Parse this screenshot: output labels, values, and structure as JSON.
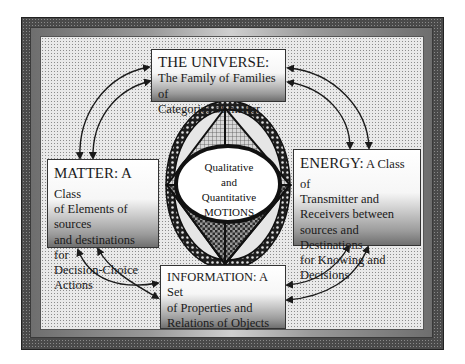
{
  "diagram": {
    "universe": {
      "head": "THE UNIVERSE:",
      "body_lines": [
        "The Family of Families of",
        "Categories of matter"
      ]
    },
    "matter": {
      "head": "MATTER: A",
      "head_tail": " Class",
      "body_lines": [
        "of Elements of sources",
        "and destinations for",
        "Decision-Choice",
        "Actions"
      ]
    },
    "energy": {
      "head": "ENERGY:",
      "head_tail": " A Class of",
      "body_lines": [
        "Transmitter and",
        "Receivers between",
        "sources and Destinations",
        "for Knowing and",
        "Decisions"
      ]
    },
    "information": {
      "head": "INFORMATION: A Set",
      "body_lines": [
        "of Properties and",
        "Relations of Objects"
      ]
    },
    "center": {
      "lines": [
        "Qualitative",
        "and",
        "Quantitative",
        "MOTIONS"
      ]
    },
    "connections": [
      {
        "from": "universe",
        "to": "matter",
        "type": "double-arrow",
        "count": 2
      },
      {
        "from": "universe",
        "to": "energy",
        "type": "double-arrow",
        "count": 2
      },
      {
        "from": "matter",
        "to": "information",
        "type": "double-arrow",
        "count": 2
      },
      {
        "from": "energy",
        "to": "information",
        "type": "double-arrow",
        "count": 2
      }
    ],
    "colors": {
      "frame_dark": "#4a4a4a",
      "panel": "#e9e9e9",
      "ink": "#1a1a1a"
    }
  }
}
